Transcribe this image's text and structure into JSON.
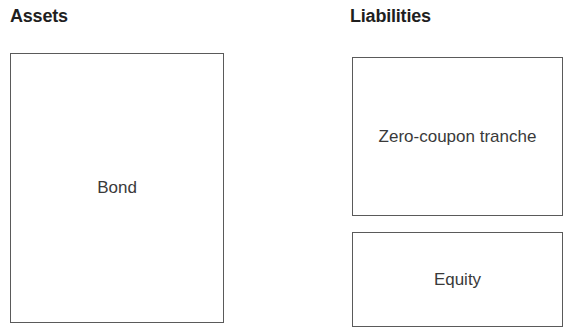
{
  "diagram": {
    "type": "block-diagram",
    "assets": {
      "heading": "Assets",
      "boxes": [
        {
          "label": "Bond"
        }
      ]
    },
    "liabilities": {
      "heading": "Liabilities",
      "boxes": [
        {
          "label": "Zero-coupon tranche"
        },
        {
          "label": "Equity"
        }
      ]
    },
    "colors": {
      "background": "#ffffff",
      "border": "#5a5a5a",
      "heading_text": "#1f1f1f",
      "label_text": "#3a3a3a"
    }
  }
}
